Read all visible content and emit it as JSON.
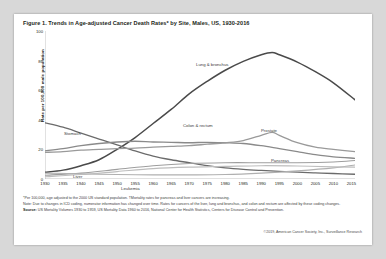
{
  "figure": {
    "title": "Figure 1. Trends in Age-adjusted Cancer Death Rates* by Site, Males, US, 1930-2016"
  },
  "notes": {
    "footnote": "*Per 100,000, age adjusted to the 2000 US standard population. †Mortality rates for pancreas and liver cancers are increasing.",
    "note": "Note: Due to changes in ICD coding, numerator information has changed over time. Rates for cancers of the liver, lung and bronchus, and colon and rectum are affected by these coding changes.",
    "source_label": "Source:",
    "source": "US Mortality Volumes 1930 to 1959, US Mortality Data 1960 to 2016, National Center for Health Statistics, Centers for Disease Control and Prevention."
  },
  "credit": "©2019, American Cancer Society, Inc., Surveillance Research",
  "chart_data": {
    "type": "line",
    "xlabel": "",
    "ylabel": "Rate per 100,000 male population",
    "xlim": [
      1930,
      2016
    ],
    "ylim": [
      0,
      100
    ],
    "yticks": [
      0,
      20,
      40,
      60,
      80,
      100
    ],
    "xticks": [
      1930,
      1935,
      1940,
      1945,
      1950,
      1955,
      1960,
      1965,
      1970,
      1975,
      1980,
      1985,
      1990,
      1995,
      2000,
      2005,
      2010,
      2015
    ],
    "grid": false,
    "legend_position": "inline-annotations",
    "annotations": [
      {
        "label": "Lung & bronchus",
        "x": 173,
        "y": 31
      },
      {
        "label": "Stomach",
        "x": 41,
        "y": 100
      },
      {
        "label": "Colon & rectum",
        "x": 160,
        "y": 92
      },
      {
        "label": "Prostate",
        "x": 238,
        "y": 97
      },
      {
        "label": "Pancreas",
        "x": 248,
        "y": 127
      },
      {
        "label": "Liver",
        "x": 50,
        "y": 143
      },
      {
        "label": "Leukemia",
        "x": 98,
        "y": 155
      }
    ],
    "series": [
      {
        "name": "Lung & bronchus",
        "color": "#4a4a4a",
        "width": 1.5,
        "x": [
          1930,
          1935,
          1940,
          1945,
          1950,
          1955,
          1960,
          1965,
          1970,
          1975,
          1980,
          1985,
          1990,
          1993,
          1995,
          2000,
          2005,
          2010,
          2016
        ],
        "values": [
          4.5,
          6.0,
          9.0,
          13.0,
          20.0,
          28.0,
          37.5,
          47.0,
          57.5,
          66.0,
          73.5,
          79.5,
          84.0,
          85.5,
          84.0,
          79.0,
          72.5,
          65.0,
          53.5
        ]
      },
      {
        "name": "Stomach",
        "color": "#6b6b6b",
        "width": 1.3,
        "x": [
          1930,
          1935,
          1940,
          1945,
          1950,
          1955,
          1960,
          1965,
          1970,
          1975,
          1980,
          1985,
          1990,
          1995,
          2000,
          2005,
          2010,
          2016
        ],
        "values": [
          38.0,
          35.0,
          31.0,
          27.0,
          23.0,
          19.0,
          15.5,
          13.0,
          11.0,
          9.0,
          7.5,
          6.5,
          5.8,
          5.2,
          4.6,
          4.1,
          3.7,
          3.2
        ]
      },
      {
        "name": "Colon & rectum",
        "color": "#8a8a8a",
        "width": 1.3,
        "x": [
          1930,
          1935,
          1940,
          1945,
          1950,
          1955,
          1960,
          1965,
          1970,
          1975,
          1980,
          1985,
          1990,
          1995,
          2000,
          2005,
          2010,
          2016
        ],
        "values": [
          19.0,
          20.5,
          22.5,
          24.0,
          25.0,
          25.5,
          25.0,
          24.8,
          24.5,
          24.8,
          24.5,
          24.0,
          22.5,
          20.5,
          18.5,
          16.5,
          15.0,
          14.0
        ]
      },
      {
        "name": "Prostate",
        "color": "#9a9a9a",
        "width": 1.3,
        "x": [
          1930,
          1935,
          1940,
          1945,
          1950,
          1955,
          1960,
          1965,
          1970,
          1975,
          1980,
          1985,
          1990,
          1993,
          1995,
          2000,
          2005,
          2010,
          2016
        ],
        "values": [
          18.0,
          18.5,
          19.5,
          20.0,
          20.5,
          20.8,
          21.5,
          22.0,
          22.5,
          23.5,
          24.5,
          26.0,
          29.5,
          31.5,
          29.5,
          24.5,
          21.5,
          20.0,
          18.5
        ]
      },
      {
        "name": "Pancreas",
        "color": "#9e9e9e",
        "width": 1.1,
        "x": [
          1930,
          1940,
          1950,
          1960,
          1970,
          1980,
          1990,
          2000,
          2010,
          2016
        ],
        "values": [
          2.5,
          4.0,
          6.5,
          9.0,
          10.5,
          11.0,
          11.0,
          11.0,
          11.5,
          12.5
        ]
      },
      {
        "name": "Liver",
        "color": "#b0b0b0",
        "width": 1.1,
        "x": [
          1930,
          1940,
          1950,
          1960,
          1970,
          1980,
          1990,
          2000,
          2010,
          2016
        ],
        "values": [
          4.0,
          3.5,
          3.0,
          2.8,
          2.8,
          3.0,
          4.0,
          5.5,
          7.5,
          9.5
        ]
      },
      {
        "name": "Leukemia",
        "color": "#bdbdbd",
        "width": 1.1,
        "x": [
          1930,
          1940,
          1950,
          1960,
          1970,
          1980,
          1990,
          2000,
          2010,
          2016
        ],
        "values": [
          1.5,
          3.0,
          5.0,
          7.0,
          8.0,
          8.5,
          9.0,
          8.8,
          8.2,
          8.0
        ]
      }
    ]
  }
}
